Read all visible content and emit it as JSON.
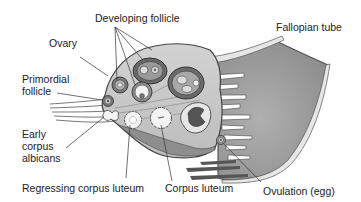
{
  "diagram": {
    "type": "anatomical-illustration",
    "colors": {
      "background": "#ffffff",
      "tube_fill": "#9a9a9a",
      "ovary_fill": "#c8c8c8",
      "line": "#333333",
      "text": "#222222"
    }
  },
  "labels": {
    "developing_follicle": "Developing follicle",
    "ovary": "Ovary",
    "fallopian_tube": "Fallopian tube",
    "primordial_follicle_line1": "Primordial",
    "primordial_follicle_line2": "follicle",
    "early_corpus_albicans_line1": "Early",
    "early_corpus_albicans_line2": "corpus",
    "early_corpus_albicans_line3": "albicans",
    "regressing_corpus_luteum": "Regressing corpus luteum",
    "corpus_luteum": "Corpus luteum",
    "ovulation": "Ovulation (egg)"
  }
}
